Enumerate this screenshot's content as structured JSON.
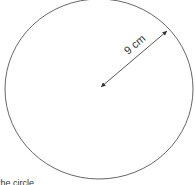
{
  "diagram": {
    "shape": "circle",
    "measurement": {
      "type": "radius",
      "label": "9 cm",
      "value": 9,
      "unit": "cm"
    },
    "caption_partial": "the circle"
  }
}
